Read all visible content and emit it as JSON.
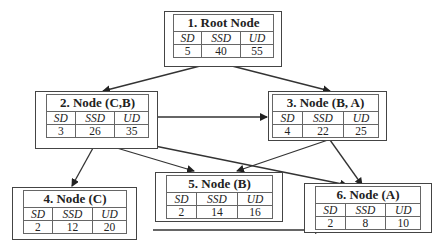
{
  "diagram": {
    "columns": [
      "SD",
      "SSD",
      "UD"
    ],
    "nodes": [
      {
        "id": 1,
        "title": "1. Root Node",
        "values": [
          "5",
          "40",
          "55"
        ]
      },
      {
        "id": 2,
        "title": "2. Node (C,B)",
        "values": [
          "3",
          "26",
          "35"
        ]
      },
      {
        "id": 3,
        "title": "3. Node (B, A)",
        "values": [
          "4",
          "22",
          "25"
        ]
      },
      {
        "id": 4,
        "title": "4. Node (C)",
        "values": [
          "2",
          "12",
          "20"
        ]
      },
      {
        "id": 5,
        "title": "5. Node (B)",
        "values": [
          "2",
          "14",
          "16"
        ]
      },
      {
        "id": 6,
        "title": "6. Node (A)",
        "values": [
          "2",
          "8",
          "10"
        ]
      }
    ],
    "edges": [
      {
        "from": 1,
        "to": 2
      },
      {
        "from": 1,
        "to": 3
      },
      {
        "from": 2,
        "to": 3
      },
      {
        "from": 2,
        "to": 4
      },
      {
        "from": 2,
        "to": 5
      },
      {
        "from": 2,
        "to": 6
      },
      {
        "from": 3,
        "to": 5
      },
      {
        "from": 3,
        "to": 6
      },
      {
        "from": 4,
        "to": 6
      }
    ]
  }
}
